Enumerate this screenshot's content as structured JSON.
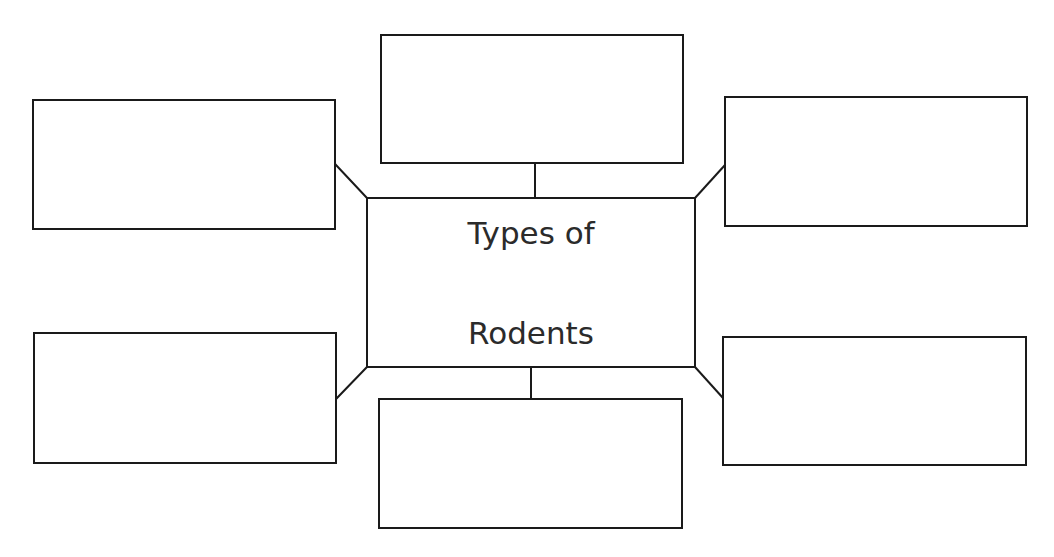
{
  "diagram": {
    "type": "graphic-organizer",
    "background": "#ffffff",
    "stroke_color": "#1a1a1a",
    "text_color": "#2b2b2b",
    "center": {
      "title_line1": "Types of",
      "title_line2": "Rodents"
    },
    "outer_boxes": [
      {
        "position": "top",
        "content": ""
      },
      {
        "position": "top-left",
        "content": ""
      },
      {
        "position": "top-right",
        "content": ""
      },
      {
        "position": "bottom-left",
        "content": ""
      },
      {
        "position": "bottom",
        "content": ""
      },
      {
        "position": "bottom-right",
        "content": ""
      }
    ]
  }
}
